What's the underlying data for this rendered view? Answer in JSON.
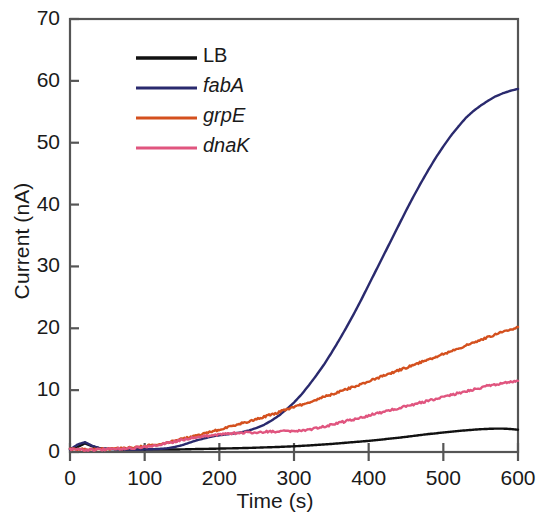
{
  "chart_data": {
    "type": "line",
    "title": "",
    "xlabel": "Time (s)",
    "ylabel": "Current (nA)",
    "xlim": [
      0,
      600
    ],
    "ylim": [
      0,
      70
    ],
    "xticks": [
      0,
      100,
      200,
      300,
      400,
      500,
      600
    ],
    "yticks": [
      0,
      10,
      20,
      30,
      40,
      50,
      60,
      70
    ],
    "grid": false,
    "legend_position": "upper left (inside axes)",
    "x": [
      0,
      10,
      20,
      30,
      40,
      50,
      60,
      70,
      80,
      90,
      100,
      110,
      120,
      130,
      140,
      150,
      160,
      170,
      180,
      190,
      200,
      210,
      220,
      230,
      240,
      250,
      260,
      270,
      280,
      290,
      300,
      310,
      320,
      330,
      340,
      350,
      360,
      370,
      380,
      390,
      400,
      410,
      420,
      430,
      440,
      450,
      460,
      470,
      480,
      490,
      500,
      510,
      520,
      530,
      540,
      550,
      560,
      570,
      580,
      590,
      600
    ],
    "series": [
      {
        "name": "LB",
        "color": "#111111",
        "italic": false,
        "final_value": 3.6,
        "values": [
          0.5,
          0.8,
          1.4,
          0.9,
          0.6,
          0.5,
          0.45,
          0.4,
          0.4,
          0.4,
          0.4,
          0.4,
          0.4,
          0.4,
          0.4,
          0.42,
          0.45,
          0.48,
          0.5,
          0.52,
          0.55,
          0.58,
          0.6,
          0.63,
          0.66,
          0.7,
          0.74,
          0.78,
          0.82,
          0.87,
          0.92,
          0.99,
          1.06,
          1.14,
          1.22,
          1.3,
          1.4,
          1.5,
          1.6,
          1.7,
          1.8,
          1.92,
          2.05,
          2.18,
          2.3,
          2.45,
          2.6,
          2.75,
          2.9,
          3.02,
          3.15,
          3.28,
          3.4,
          3.5,
          3.6,
          3.68,
          3.74,
          3.78,
          3.78,
          3.72,
          3.6
        ]
      },
      {
        "name": "fabA",
        "color": "#2a2a6e",
        "italic": true,
        "final_value": 58.7,
        "values": [
          0.4,
          1.2,
          1.6,
          1.0,
          0.6,
          0.5,
          0.45,
          0.42,
          0.4,
          0.4,
          0.42,
          0.45,
          0.5,
          0.6,
          0.8,
          1.1,
          1.5,
          1.9,
          2.2,
          2.5,
          2.7,
          2.85,
          3.0,
          3.2,
          3.5,
          3.9,
          4.4,
          5.1,
          5.9,
          6.9,
          8.0,
          9.3,
          10.8,
          12.4,
          14.1,
          16.0,
          18.0,
          20.1,
          22.3,
          24.6,
          27.0,
          29.4,
          31.8,
          34.2,
          36.6,
          39.0,
          41.3,
          43.5,
          45.6,
          47.6,
          49.4,
          51.1,
          52.6,
          54.0,
          55.1,
          56.0,
          56.8,
          57.5,
          58.0,
          58.4,
          58.7
        ]
      },
      {
        "name": "grpE",
        "color": "#d4501e",
        "italic": true,
        "final_value": 20.2,
        "values": [
          0.5,
          0.45,
          0.4,
          0.42,
          0.45,
          0.5,
          0.55,
          0.62,
          0.7,
          0.8,
          0.95,
          1.1,
          1.3,
          1.55,
          1.8,
          2.1,
          2.4,
          2.7,
          3.0,
          3.3,
          3.6,
          3.95,
          4.3,
          4.65,
          5.0,
          5.35,
          5.7,
          6.05,
          6.45,
          6.85,
          7.25,
          7.65,
          8.05,
          8.45,
          8.9,
          9.3,
          9.7,
          10.1,
          10.55,
          11.0,
          11.45,
          11.9,
          12.3,
          12.75,
          13.2,
          13.6,
          14.05,
          14.5,
          14.95,
          15.4,
          15.85,
          16.3,
          16.75,
          17.2,
          17.65,
          18.1,
          18.55,
          19.0,
          19.4,
          19.8,
          20.2
        ]
      },
      {
        "name": "dnaK",
        "color": "#e0557f",
        "italic": true,
        "final_value": 11.5,
        "values": [
          0.45,
          0.4,
          0.38,
          0.4,
          0.42,
          0.45,
          0.5,
          0.55,
          0.62,
          0.72,
          0.85,
          1.0,
          1.2,
          1.45,
          1.7,
          1.95,
          2.2,
          2.4,
          2.55,
          2.7,
          2.85,
          2.95,
          3.05,
          3.1,
          3.15,
          3.2,
          3.25,
          3.3,
          3.3,
          3.35,
          3.4,
          3.5,
          3.65,
          3.85,
          4.1,
          4.4,
          4.7,
          5.0,
          5.3,
          5.6,
          5.9,
          6.2,
          6.5,
          6.8,
          7.1,
          7.4,
          7.7,
          8.0,
          8.3,
          8.6,
          8.9,
          9.2,
          9.5,
          9.8,
          10.1,
          10.4,
          10.7,
          10.95,
          11.15,
          11.35,
          11.5
        ]
      }
    ]
  },
  "axes": {
    "ylabel": "Current (nA)",
    "xlabel": "Time (s)",
    "yticks": [
      "0",
      "10",
      "20",
      "30",
      "40",
      "50",
      "60",
      "70"
    ],
    "xticks": [
      "0",
      "100",
      "200",
      "300",
      "400",
      "500",
      "600"
    ]
  },
  "legend": {
    "items": [
      {
        "label": "LB",
        "color": "#111111"
      },
      {
        "label": "fabA",
        "color": "#2a2a6e"
      },
      {
        "label": "grpE",
        "color": "#d4501e"
      },
      {
        "label": "dnaK",
        "color": "#e0557f"
      }
    ]
  }
}
